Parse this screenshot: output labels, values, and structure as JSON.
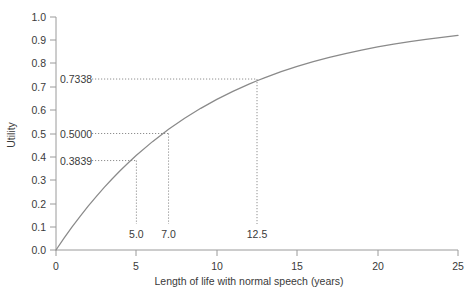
{
  "chart_data": {
    "type": "line",
    "title": "",
    "xlabel": "Length of life with normal speech (years)",
    "ylabel": "Utility",
    "xlim": [
      0,
      25
    ],
    "ylim": [
      0,
      1.0
    ],
    "grid": false,
    "legend": "none",
    "x_ticks": [
      "0",
      "5",
      "10",
      "15",
      "20",
      "25"
    ],
    "x_tick_values": [
      0,
      5,
      10,
      15,
      20,
      25
    ],
    "y_ticks": [
      "0.0",
      "0.1",
      "0.2",
      "0.3",
      "0.4",
      "0.5",
      "0.6",
      "0.7",
      "0.8",
      "0.9",
      "1.0"
    ],
    "y_tick_values": [
      0.0,
      0.1,
      0.2,
      0.3,
      0.4,
      0.5,
      0.6,
      0.7,
      0.8,
      0.9,
      1.0
    ],
    "series": [
      {
        "name": "Utility curve",
        "x": [
          0,
          0.5,
          1,
          1.5,
          2,
          2.5,
          3,
          3.5,
          4,
          4.5,
          5,
          6,
          7,
          8,
          9,
          10,
          11,
          12,
          12.5,
          13,
          14,
          15,
          16,
          17,
          18,
          19,
          20,
          21,
          22,
          23,
          24,
          25
        ],
        "y": [
          0.0,
          0.0508,
          0.099,
          0.1447,
          0.1882,
          0.2294,
          0.2685,
          0.3057,
          0.341,
          0.3745,
          0.4063,
          0.4651,
          0.5178,
          0.5653,
          0.608,
          0.6464,
          0.681,
          0.7121,
          0.7265,
          0.7401,
          0.7653,
          0.788,
          0.8084,
          0.8267,
          0.8432,
          0.8581,
          0.8715,
          0.8835,
          0.8943,
          0.9041,
          0.9129,
          0.9208
        ]
      }
    ],
    "annotations": [
      {
        "name": "point-5.0",
        "x": 5.0,
        "y": 0.3839,
        "x_label": "5.0",
        "y_label": "0.3839"
      },
      {
        "name": "point-7.0",
        "x": 7.0,
        "y": 0.5,
        "x_label": "7.0",
        "y_label": "0.5000"
      },
      {
        "name": "point-12.5",
        "x": 12.5,
        "y": 0.7338,
        "x_label": "12.5",
        "y_label": "0.7338"
      }
    ]
  },
  "colors": {
    "curve": "#8a8a8a",
    "axis": "#9a9a9a",
    "dotted": "#8f8f8f",
    "text": "#3a3a3a",
    "background": "#ffffff"
  }
}
